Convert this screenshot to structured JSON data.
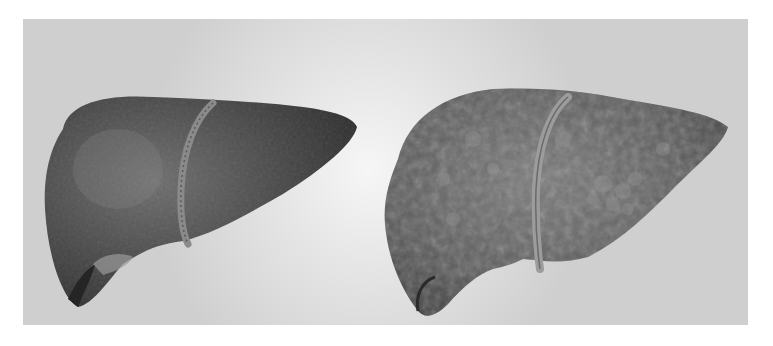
{
  "figure": {
    "panel_background": "#d4d4d4",
    "left_specimen": {
      "label": "healthy-liver",
      "tone": "#4a4a4a",
      "surface": "smooth"
    },
    "right_specimen": {
      "label": "cirrhotic-liver",
      "tone": "#5a5a5a",
      "surface": "nodular"
    }
  }
}
